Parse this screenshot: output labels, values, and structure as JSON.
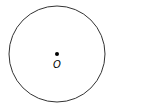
{
  "diagram": {
    "type": "circle-with-center",
    "circle": {
      "cx": 57,
      "cy": 54,
      "r": 48,
      "stroke": "#333333"
    },
    "center_point": {
      "cx": 57,
      "cy": 54,
      "r": 2,
      "fill": "#000000"
    },
    "center_label": "O"
  }
}
